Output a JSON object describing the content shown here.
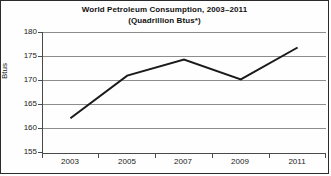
{
  "chart_data": {
    "type": "line",
    "title": "World Petroleum Consumption, 2003–2011",
    "subtitle": "(Quadrillion Btus*)",
    "xlabel": "",
    "ylabel": "Btus",
    "x": [
      2003,
      2004,
      2005,
      2006,
      2007,
      2008,
      2009,
      2010,
      2011
    ],
    "categories": [
      "2003",
      "2004",
      "2005",
      "2006",
      "2007",
      "2008",
      "2009",
      "2010",
      "2011"
    ],
    "x_tick_labels": [
      "2003",
      "2005",
      "2007",
      "2009",
      "2011"
    ],
    "y_tick_labels": [
      "180",
      "175",
      "170",
      "165",
      "160",
      "155"
    ],
    "y_ticks": [
      180,
      175,
      170,
      165,
      160,
      155
    ],
    "values": [
      162.2,
      166.6,
      171.0,
      172.7,
      174.3,
      172.3,
      170.2,
      173.5,
      176.8
    ],
    "series": [
      {
        "name": "World Petroleum Consumption",
        "values": [
          162.2,
          166.6,
          171.0,
          172.7,
          174.3,
          172.3,
          170.2,
          173.5,
          176.8
        ]
      }
    ],
    "vertices": [
      {
        "x": 2003,
        "y": 162.2
      },
      {
        "x": 2005,
        "y": 171.0
      },
      {
        "x": 2007,
        "y": 174.3
      },
      {
        "x": 2009,
        "y": 170.2
      },
      {
        "x": 2011,
        "y": 176.8
      }
    ],
    "xlim": [
      2002,
      2012
    ],
    "ylim": [
      155,
      180
    ],
    "grid": "horizontal",
    "legend": "none",
    "line_color": "#1a1a1a",
    "grid_color": "#8d8d8d",
    "axis_color": "#4a4a4a",
    "background_color": "#fefefe",
    "border_color": "#2b2b2b"
  }
}
